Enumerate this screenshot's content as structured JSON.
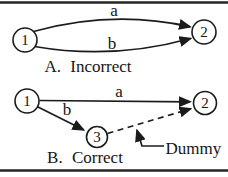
{
  "colors": {
    "ink": "#1b1b1b",
    "background": "#ffffff"
  },
  "diagram_a": {
    "caption": "A. Incorrect",
    "node1_label": "1",
    "node2_label": "2",
    "edge_a_label": "a",
    "edge_b_label": "b"
  },
  "diagram_b": {
    "caption": "B. Correct",
    "node1_label": "1",
    "node2_label": "2",
    "node3_label": "3",
    "edge_a_label": "a",
    "edge_b_label": "b",
    "dummy_edge_label": "Dummy"
  }
}
